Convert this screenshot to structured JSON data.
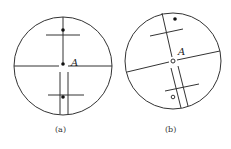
{
  "figures": [
    {
      "id": "a",
      "caption": "(a)",
      "point_label": "A",
      "description": "Reticle view with vertical crosshair aligned, filled dots on vertical line"
    },
    {
      "id": "b",
      "caption": "(b)",
      "point_label": "A",
      "description": "Reticle view rotated, with filled dot off-axis above and hollow dot below"
    }
  ],
  "colors": {
    "line": "#333333",
    "background": "#ffffff"
  }
}
